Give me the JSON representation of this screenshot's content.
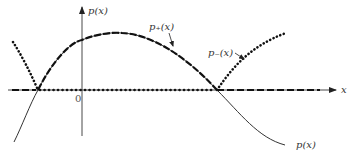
{
  "diagram": {
    "type": "function-plot",
    "axes": {
      "x_label": "x",
      "y_label": "p(x)",
      "origin_label": "0"
    },
    "curves": [
      {
        "name": "p(x)",
        "label": "p(x)",
        "style": "solid-thin",
        "description": "original function, crosses x-axis at two roots, positive between them, negative outside"
      },
      {
        "name": "p_plus",
        "label": "p₊(x)",
        "style": "dashed-bold",
        "description": "positive part: equals p(x) between roots, zero elsewhere"
      },
      {
        "name": "p_minus",
        "label": "p₋(x)",
        "style": "dotted-bold",
        "description": "negative part magnitude: equals -p(x) outside roots, zero between"
      }
    ],
    "labels": {
      "y_axis": "p(x)",
      "x_axis": "x",
      "origin": "0",
      "p_plus": "p₊(x)",
      "p_minus": "p₋(x)",
      "p": "p(x)"
    },
    "colors": {
      "line": "#222222",
      "background": "#ffffff"
    }
  }
}
